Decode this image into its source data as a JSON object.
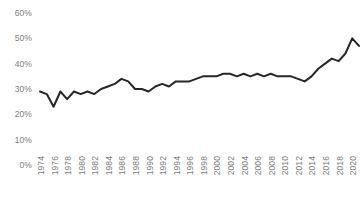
{
  "chart_data": {
    "type": "line",
    "title": "",
    "subtitle": "",
    "xlabel": "",
    "ylabel": "",
    "ylim": [
      0,
      60
    ],
    "yticks": [
      0,
      10,
      20,
      30,
      40,
      50,
      60
    ],
    "ytick_labels": [
      "0%",
      "10%",
      "20%",
      "30%",
      "40%",
      "50%",
      "60%"
    ],
    "xlim": [
      1974,
      2021
    ],
    "xtick_labels": [
      "1974",
      "1976",
      "1978",
      "1980",
      "1982",
      "1984",
      "1986",
      "1988",
      "1990",
      "1992",
      "1994",
      "1996",
      "1998",
      "2000",
      "2002",
      "2004",
      "2006",
      "2008",
      "2010",
      "2012",
      "2014",
      "2016",
      "2018",
      "2020"
    ],
    "grid": false,
    "legend": false,
    "legend_position": "none",
    "series_color": "#262626",
    "line_width": 2.0,
    "x": [
      1974,
      1975,
      1976,
      1977,
      1978,
      1979,
      1980,
      1981,
      1982,
      1983,
      1984,
      1985,
      1986,
      1987,
      1988,
      1989,
      1990,
      1991,
      1992,
      1993,
      1994,
      1995,
      1996,
      1997,
      1998,
      1999,
      2000,
      2001,
      2002,
      2003,
      2004,
      2005,
      2006,
      2007,
      2008,
      2009,
      2010,
      2011,
      2012,
      2013,
      2014,
      2015,
      2016,
      2017,
      2018,
      2019,
      2020,
      2021
    ],
    "series": [
      {
        "name": "Share",
        "values": [
          29,
          28,
          23,
          29,
          26,
          29,
          28,
          29,
          28,
          30,
          31,
          32,
          34,
          33,
          30,
          30,
          29,
          31,
          32,
          31,
          33,
          33,
          33,
          34,
          35,
          35,
          35,
          36,
          36,
          35,
          36,
          35,
          36,
          35,
          36,
          35,
          35,
          35,
          34,
          33,
          35,
          38,
          40,
          42,
          41,
          44,
          50,
          47
        ]
      }
    ]
  }
}
